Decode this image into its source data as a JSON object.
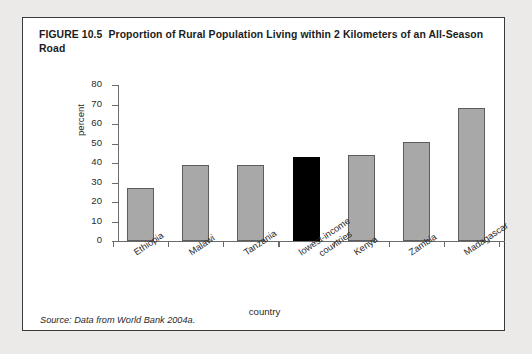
{
  "figure": {
    "number": "FIGURE 10.5",
    "title": "Proportion of Rural Population Living within 2 Kilometers of an All-Season Road",
    "source": "Source: Data from World Bank 2004a."
  },
  "colors": {
    "bar_fill": "#a8a8a8",
    "bar_border": "#5d5d5d",
    "highlight_fill": "#000000",
    "axis": "#6b6b6b",
    "frame": "#3a3a3a",
    "page_background": "#eceae8",
    "figure_background": "#ffffff"
  },
  "chart_data": {
    "type": "bar",
    "title": "Proportion of Rural Population Living within 2 Kilometers of an All-Season Road",
    "xlabel": "country",
    "ylabel": "percent",
    "ylim": [
      0,
      80
    ],
    "yticks": [
      0,
      10,
      20,
      30,
      40,
      50,
      60,
      70,
      80
    ],
    "ytick_labels": [
      "0",
      "10",
      "20",
      "30",
      "40",
      "50",
      "60",
      "70",
      "80"
    ],
    "grid": false,
    "legend": "none",
    "categories": [
      "Ethiopia",
      "Malawi",
      "Tanzania",
      "lowest-income countries",
      "Kenya",
      "Zambia",
      "Madagascar"
    ],
    "category_lines": [
      [
        "Ethiopia"
      ],
      [
        "Malawi"
      ],
      [
        "Tanzania"
      ],
      [
        "lowest-income",
        "countries"
      ],
      [
        "Kenya"
      ],
      [
        "Zambia"
      ],
      [
        "Madagascar"
      ]
    ],
    "values": [
      27,
      39,
      39,
      43,
      44,
      51,
      68
    ],
    "highlighted": [
      false,
      false,
      false,
      true,
      false,
      false,
      false
    ]
  }
}
